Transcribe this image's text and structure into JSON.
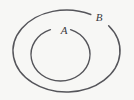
{
  "figure": {
    "type": "set-containment-diagram",
    "background_color": "#f7f7f5",
    "stroke_color": "#55555a",
    "label_color": "#3a3a3d"
  },
  "sets": {
    "inner": {
      "label": "A",
      "shape": "ellipse",
      "center_x": 60.5,
      "center_y": 54.5,
      "radius_x": 29.5,
      "radius_y": 26.5,
      "stroke_width": 1.4,
      "label_x": 64,
      "label_y": 34,
      "label_font_size": 11,
      "gap_start_deg": 250,
      "gap_end_deg": 290
    },
    "outer": {
      "label": "B",
      "shape": "ellipse",
      "center_x": 66.5,
      "center_y": 51,
      "radius_x": 53.5,
      "radius_y": 41,
      "stroke_width": 1.5,
      "label_x": 99,
      "label_y": 21,
      "label_font_size": 11,
      "gap_start_deg": 297,
      "gap_end_deg": 322
    }
  }
}
